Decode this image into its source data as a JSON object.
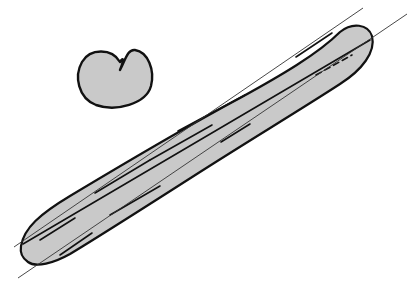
{
  "figure": {
    "colors": {
      "background": "#ffffff",
      "fill": "#c9c9c9",
      "outline": "#111111",
      "guide_line": "#333333"
    },
    "roll": {
      "label": "round-roll",
      "path": "M120,62 C112,48 90,48 82,62 C74,76 78,98 96,105 C116,112 146,104 151,86 C155,70 148,52 135,50 C128,49 126,58 120,70 C124,60 124,56 120,62 Z"
    },
    "baguette": {
      "label": "baguette",
      "outline": "M21,246 C24,228 40,214 70,196 C120,166 180,130 240,98 C280,76 318,54 340,32 C352,22 368,24 372,36 C376,52 362,70 340,84 C300,110 250,140 200,172 C150,204 100,236 70,254 C54,263 36,268 28,262 C22,258 20,252 21,246 Z",
      "scores": [
        {
          "x1": 23,
          "y1": 244,
          "x2": 370,
          "y2": 40,
          "dash": ""
        },
        {
          "x1": 95,
          "y1": 193,
          "x2": 150,
          "y2": 160,
          "dash": ""
        },
        {
          "x1": 150,
          "y1": 160,
          "x2": 212,
          "y2": 125,
          "dash": ""
        },
        {
          "x1": 178,
          "y1": 131,
          "x2": 245,
          "y2": 95,
          "dash": ""
        },
        {
          "x1": 221,
          "y1": 142,
          "x2": 250,
          "y2": 124,
          "dash": ""
        },
        {
          "x1": 296,
          "y1": 57,
          "x2": 332,
          "y2": 33,
          "dash": ""
        },
        {
          "x1": 316,
          "y1": 75,
          "x2": 352,
          "y2": 55,
          "dash": "6 4"
        },
        {
          "x1": 40,
          "y1": 240,
          "x2": 75,
          "y2": 218,
          "dash": ""
        },
        {
          "x1": 60,
          "y1": 255,
          "x2": 92,
          "y2": 233,
          "dash": ""
        },
        {
          "x1": 110,
          "y1": 215,
          "x2": 160,
          "y2": 186,
          "dash": ""
        }
      ],
      "guide_lines": [
        {
          "x1": 14,
          "y1": 247,
          "x2": 363,
          "y2": 8
        },
        {
          "x1": 18,
          "y1": 278,
          "x2": 407,
          "y2": 14
        }
      ]
    },
    "clipped_caption": "· · ·"
  }
}
